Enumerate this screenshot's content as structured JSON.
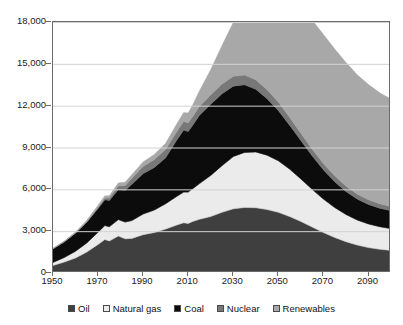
{
  "chart_data": {
    "type": "area",
    "stacked": true,
    "title": "",
    "subtitle": "",
    "xlabel": "",
    "ylabel": "",
    "xlim": [
      1950,
      2100
    ],
    "ylim": [
      0,
      18000
    ],
    "ytick_labels": [
      "0",
      "3,000",
      "6,000",
      "9,000",
      "12,000",
      "15,000",
      "18,000"
    ],
    "ytick_values": [
      0,
      3000,
      6000,
      9000,
      12000,
      15000,
      18000
    ],
    "xtick_labels": [
      "1950",
      "1970",
      "1990",
      "2010",
      "2030",
      "2050",
      "2070",
      "2090"
    ],
    "xtick_values": [
      1950,
      1970,
      1990,
      2010,
      2030,
      2050,
      2070,
      2090
    ],
    "grid": "horizontal",
    "legend_position": "bottom",
    "x": [
      1950,
      1955,
      1960,
      1965,
      1970,
      1973,
      1975,
      1979,
      1982,
      1985,
      1990,
      1995,
      2000,
      2005,
      2008,
      2010,
      2012,
      2015,
      2020,
      2025,
      2030,
      2035,
      2040,
      2045,
      2050,
      2055,
      2060,
      2065,
      2070,
      2075,
      2080,
      2085,
      2090,
      2095,
      2100
    ],
    "series": [
      {
        "name": "Oil",
        "color": "#3f3f3f",
        "values": [
          540,
          780,
          1080,
          1500,
          2050,
          2400,
          2300,
          2650,
          2450,
          2480,
          2750,
          2900,
          3150,
          3450,
          3600,
          3550,
          3700,
          3850,
          4050,
          4350,
          4600,
          4700,
          4680,
          4550,
          4350,
          4050,
          3700,
          3300,
          2900,
          2550,
          2250,
          2000,
          1820,
          1700,
          1620
        ]
      },
      {
        "name": "Natural gas",
        "color": "#ebebeb",
        "values": [
          220,
          330,
          480,
          660,
          880,
          1000,
          1020,
          1180,
          1200,
          1280,
          1480,
          1620,
          1820,
          2050,
          2200,
          2250,
          2350,
          2560,
          2950,
          3350,
          3750,
          3950,
          4000,
          3900,
          3700,
          3400,
          3050,
          2700,
          2400,
          2150,
          1950,
          1800,
          1700,
          1620,
          1560
        ]
      },
      {
        "name": "Coal",
        "color": "#0c0c0c",
        "values": [
          980,
          1130,
          1300,
          1480,
          1700,
          1850,
          1880,
          2150,
          2280,
          2600,
          2900,
          3050,
          3300,
          4050,
          4450,
          4350,
          4550,
          4900,
          5100,
          5150,
          5050,
          4850,
          4500,
          4050,
          3600,
          3150,
          2750,
          2400,
          2100,
          1850,
          1650,
          1500,
          1400,
          1330,
          1280
        ]
      },
      {
        "name": "Nuclear",
        "color": "#787878",
        "values": [
          0,
          2,
          10,
          40,
          90,
          130,
          170,
          280,
          350,
          430,
          520,
          570,
          600,
          620,
          630,
          620,
          630,
          650,
          680,
          700,
          710,
          700,
          680,
          650,
          610,
          570,
          530,
          490,
          450,
          420,
          390,
          360,
          340,
          320,
          300
        ]
      },
      {
        "name": "Renewables",
        "color": "#a8a8a8",
        "values": [
          30,
          45,
          65,
          95,
          130,
          150,
          165,
          200,
          230,
          260,
          310,
          360,
          430,
          540,
          620,
          700,
          820,
          1100,
          1800,
          2750,
          3850,
          5000,
          6100,
          7100,
          7950,
          8600,
          9050,
          9250,
          9250,
          9100,
          8850,
          8550,
          8250,
          7950,
          7700
        ]
      }
    ],
    "annotations": []
  },
  "legend": {
    "items": [
      {
        "label": "Oil",
        "color": "#3f3f3f"
      },
      {
        "label": "Natural gas",
        "color": "#ebebeb"
      },
      {
        "label": "Coal",
        "color": "#0c0c0c"
      },
      {
        "label": "Nuclear",
        "color": "#787878"
      },
      {
        "label": "Renewables",
        "color": "#a8a8a8"
      }
    ]
  }
}
